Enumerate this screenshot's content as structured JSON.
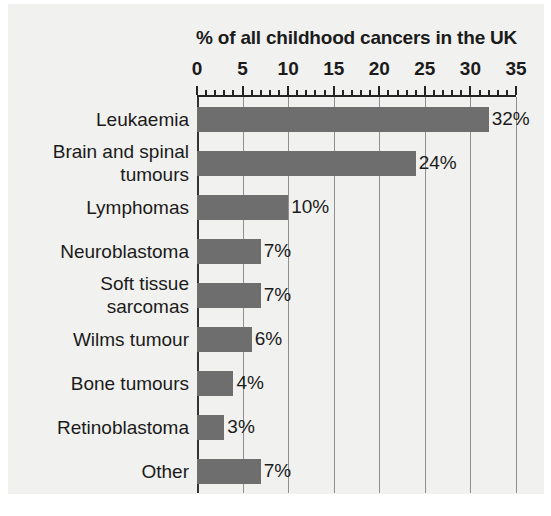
{
  "chart_data": {
    "type": "bar",
    "orientation": "horizontal",
    "title": "% of all childhood cancers in the UK",
    "xlabel": "",
    "ylabel": "",
    "xlim": [
      0,
      35
    ],
    "xticks": [
      0,
      5,
      10,
      15,
      20,
      25,
      30,
      35
    ],
    "xtick_labels": [
      "0",
      "5",
      "10",
      "15",
      "20",
      "25",
      "30",
      "35"
    ],
    "minor_tick_step": 1,
    "grid": "vertical-major",
    "legend": null,
    "categories": [
      "Leukaemia",
      "Brain and spinal\ntumours",
      "Lymphomas",
      "Neuroblastoma",
      "Soft tissue\nsarcomas",
      "Wilms tumour",
      "Bone tumours",
      "Retinoblastoma",
      "Other"
    ],
    "values": [
      32,
      24,
      10,
      7,
      7,
      6,
      4,
      3,
      7
    ],
    "value_labels": [
      "32%",
      "24%",
      "10%",
      "7%",
      "7%",
      "6%",
      "4%",
      "3%",
      "7%"
    ],
    "colors": {
      "bar": "#6e6e6e",
      "background": "#f1f1ef",
      "text": "#1b1b1b",
      "axis": "#232323",
      "grid": "#8f8f8f"
    }
  }
}
